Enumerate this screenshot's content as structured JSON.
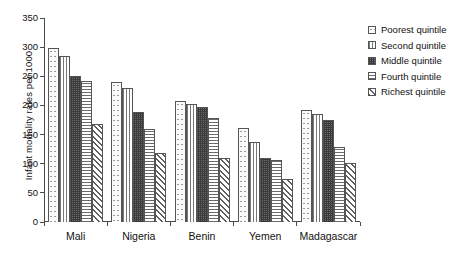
{
  "chart_data": {
    "type": "bar",
    "title": "",
    "xlabel": "",
    "ylabel": "Infant mortality rates per 1000",
    "ylim": [
      0,
      350
    ],
    "ytick_step": 50,
    "yticks": [
      0,
      50,
      100,
      150,
      200,
      250,
      300,
      350
    ],
    "grid": false,
    "legend_position": "right",
    "categories": [
      "Mali",
      "Nigeria",
      "Benin",
      "Yemen",
      "Madagascar"
    ],
    "series": [
      {
        "name": "Poorest quintile",
        "pattern": "light-dots",
        "values": [
          299,
          240,
          208,
          162,
          192
        ]
      },
      {
        "name": "Second quintile",
        "pattern": "vertical-lines",
        "values": [
          285,
          230,
          203,
          138,
          185
        ]
      },
      {
        "name": "Middle quintile",
        "pattern": "dark-checker",
        "values": [
          251,
          189,
          198,
          110,
          175
        ]
      },
      {
        "name": "Fourth quintile",
        "pattern": "horizontal-lines",
        "values": [
          242,
          159,
          178,
          107,
          128
        ]
      },
      {
        "name": "Richest quintile",
        "pattern": "diagonal-hatch",
        "values": [
          168,
          119,
          110,
          73,
          101
        ]
      }
    ]
  },
  "legend": {
    "items": [
      {
        "label": "Poorest quintile"
      },
      {
        "label": "Second quintile"
      },
      {
        "label": "Middle quintile"
      },
      {
        "label": "Fourth quintile"
      },
      {
        "label": "Richest quintile"
      }
    ]
  },
  "colors": {
    "axis": "#4a4a4a",
    "bar_outline": "#555555",
    "text": "#111111",
    "background": "#ffffff"
  }
}
